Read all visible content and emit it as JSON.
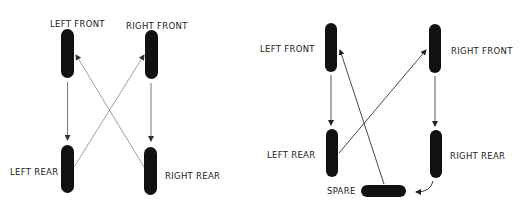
{
  "diagrams": {
    "four_wheel": {
      "labels": {
        "left_front": "LEFT FRONT",
        "right_front": "RIGHT FRONT",
        "left_rear": "LEFT REAR",
        "right_rear": "RIGHT REAR"
      },
      "rotation": [
        {
          "from": "left_front",
          "to": "left_rear"
        },
        {
          "from": "right_front",
          "to": "right_rear"
        },
        {
          "from": "left_rear",
          "to": "right_front"
        },
        {
          "from": "right_rear",
          "to": "left_front"
        }
      ]
    },
    "five_wheel": {
      "labels": {
        "left_front": "LEFT FRONT",
        "right_front": "RIGHT FRONT",
        "left_rear": "LEFT REAR",
        "right_rear": "RIGHT REAR",
        "spare": "SPARE"
      },
      "rotation": [
        {
          "from": "left_front",
          "to": "left_rear"
        },
        {
          "from": "right_front",
          "to": "right_rear"
        },
        {
          "from": "left_rear",
          "to": "right_front"
        },
        {
          "from": "right_rear",
          "to": "spare"
        },
        {
          "from": "spare",
          "to": "left_front"
        }
      ]
    }
  },
  "colors": {
    "tire": "#111111",
    "arrow": "#333333",
    "text": "#222222",
    "background": "#ffffff"
  }
}
